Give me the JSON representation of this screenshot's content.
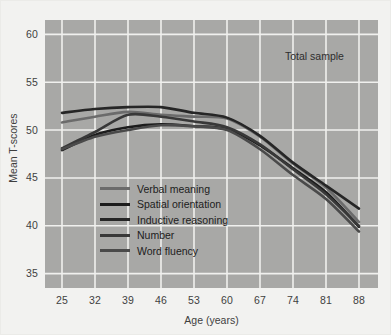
{
  "figure": {
    "annotation": "Total sample",
    "plot_bg_color": "#a8a8a6",
    "page_bg_color": "#f2f2f0",
    "grid_color": "#f0f0ee"
  },
  "chart_data": {
    "type": "line",
    "title": "",
    "subtitle": "",
    "annotations": [
      "Total sample"
    ],
    "xlabel": "Age (years)",
    "ylabel": "Mean T-scores",
    "x": [
      25,
      32,
      39,
      46,
      53,
      60,
      67,
      74,
      81,
      88
    ],
    "xticklabels": [
      "25",
      "32",
      "39",
      "46",
      "53",
      "60",
      "67",
      "74",
      "81",
      "88"
    ],
    "yticks": [
      35,
      40,
      45,
      50,
      55,
      60
    ],
    "yticklabels": [
      "35",
      "40",
      "45",
      "50",
      "55",
      "60"
    ],
    "xlim": [
      25,
      88
    ],
    "ylim": [
      33.5,
      61.5
    ],
    "grid": true,
    "legend_position": "lower-left-inside",
    "series": [
      {
        "name": "Verbal meaning",
        "color": "#6b6b6b",
        "width": 2.6,
        "values": [
          50.8,
          51.4,
          51.9,
          51.6,
          51.4,
          51.2,
          49.3,
          46.5,
          44.0,
          40.4
        ]
      },
      {
        "name": "Spatial orientation",
        "color": "#1c1c1c",
        "width": 2.6,
        "values": [
          47.9,
          49.5,
          50.3,
          50.6,
          50.4,
          50.1,
          48.4,
          46.0,
          43.5,
          39.9
        ]
      },
      {
        "name": "Inductive reasoning",
        "color": "#262626",
        "width": 2.6,
        "values": [
          51.8,
          52.2,
          52.4,
          52.4,
          51.8,
          51.3,
          49.4,
          46.6,
          44.2,
          41.8
        ]
      },
      {
        "name": "Number",
        "color": "#383838",
        "width": 2.6,
        "values": [
          48.1,
          49.8,
          51.6,
          51.4,
          50.9,
          50.3,
          48.5,
          45.9,
          43.3,
          40.0
        ]
      },
      {
        "name": "Word fluency",
        "color": "#4a4a4a",
        "width": 2.6,
        "values": [
          48.0,
          49.3,
          50.0,
          50.5,
          50.4,
          50.0,
          48.0,
          45.3,
          42.8,
          39.4
        ]
      }
    ]
  },
  "legend": {
    "items": [
      {
        "label": "Verbal meaning",
        "color": "#6b6b6b"
      },
      {
        "label": "Spatial orientation",
        "color": "#1c1c1c"
      },
      {
        "label": "Inductive reasoning",
        "color": "#262626"
      },
      {
        "label": "Number",
        "color": "#383838"
      },
      {
        "label": "Word fluency",
        "color": "#4a4a4a"
      }
    ]
  }
}
